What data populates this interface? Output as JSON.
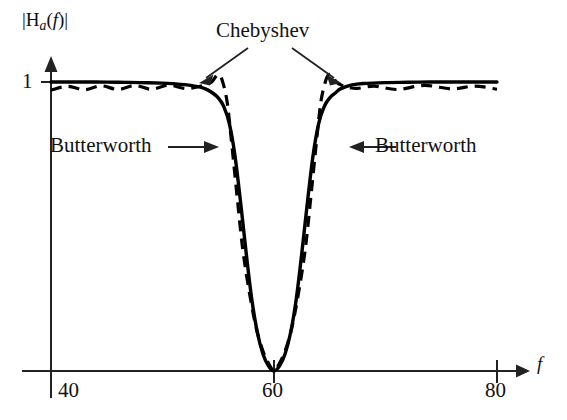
{
  "figure": {
    "axis": {
      "y_label_parts": {
        "bar_open": "|",
        "h": "H",
        "sub_a": "a",
        "paren_open": "(",
        "f": "f",
        "paren_close": ")",
        "bar_close": "|"
      },
      "y_label_text": "|H_a(f)|",
      "x_label": "f",
      "y_tick_label": "1",
      "x_tick_labels": [
        "40",
        "60",
        "80"
      ]
    },
    "annotations": {
      "chebyshev": "Chebyshev",
      "butterworth_left": "Butterworth",
      "butterworth_right": "Butterworth"
    },
    "colors": {
      "ink": "#111111",
      "axis": "#222222",
      "curve": "#000000"
    }
  },
  "chart_data": {
    "type": "line",
    "title": "",
    "subtitle": "",
    "xlabel": "f",
    "ylabel": "|H_a(f)|",
    "xlim": [
      38,
      82
    ],
    "ylim": [
      0,
      1.12
    ],
    "grid": false,
    "legend_position": "inline-annotations",
    "xticks": [
      40,
      60,
      80
    ],
    "yticks": [
      1
    ],
    "xtick_labels": [
      "40",
      "60",
      "80"
    ],
    "ytick_labels": [
      "1"
    ],
    "annotations": [
      {
        "text": "Chebyshev",
        "points_to": [
          [
            55.1,
            1.02
          ],
          [
            65.0,
            1.02
          ]
        ]
      },
      {
        "text": "Butterworth",
        "points_to": [
          [
            56.6,
            0.75
          ]
        ]
      },
      {
        "text": "Butterworth",
        "points_to": [
          [
            64.2,
            0.75
          ]
        ]
      }
    ],
    "series": [
      {
        "name": "Butterworth",
        "style": "solid",
        "x": [
          40.0,
          42.0,
          44.0,
          46.0,
          48.0,
          50.0,
          51.0,
          52.0,
          53.0,
          53.8,
          54.5,
          55.0,
          55.5,
          56.0,
          56.5,
          57.0,
          57.5,
          58.0,
          58.5,
          59.0,
          59.5,
          60.0,
          60.5,
          61.0,
          61.5,
          62.0,
          62.5,
          63.0,
          63.5,
          64.0,
          64.5,
          65.0,
          65.5,
          66.0,
          67.0,
          68.0,
          70.0,
          72.0,
          74.0,
          76.0,
          78.0,
          80.0
        ],
        "y": [
          1.0,
          1.0,
          1.0,
          0.999,
          0.998,
          0.996,
          0.994,
          0.991,
          0.985,
          0.977,
          0.962,
          0.945,
          0.915,
          0.855,
          0.745,
          0.585,
          0.41,
          0.25,
          0.135,
          0.06,
          0.018,
          0.0,
          0.018,
          0.06,
          0.135,
          0.25,
          0.41,
          0.585,
          0.745,
          0.855,
          0.915,
          0.945,
          0.962,
          0.977,
          0.99,
          0.995,
          0.998,
          0.999,
          1.0,
          1.0,
          1.0,
          1.0
        ]
      },
      {
        "name": "Chebyshev",
        "style": "dashed",
        "x": [
          40.0,
          41.5,
          43.0,
          44.5,
          46.0,
          47.5,
          49.0,
          50.5,
          52.0,
          53.0,
          53.8,
          54.4,
          54.8,
          55.1,
          55.4,
          55.8,
          56.2,
          56.7,
          57.2,
          57.8,
          58.4,
          59.0,
          59.6,
          60.0,
          60.4,
          61.0,
          61.6,
          62.2,
          62.8,
          63.3,
          63.8,
          64.2,
          64.6,
          64.9,
          65.2,
          65.6,
          66.0,
          66.6,
          67.5,
          69.0,
          71.0,
          73.5,
          76.0,
          78.0,
          80.0
        ],
        "y": [
          0.972,
          0.985,
          0.973,
          0.987,
          0.974,
          0.988,
          0.975,
          0.989,
          0.978,
          0.982,
          0.99,
          1.0,
          1.02,
          1.025,
          1.0,
          0.93,
          0.79,
          0.6,
          0.42,
          0.27,
          0.15,
          0.07,
          0.02,
          0.0,
          0.02,
          0.07,
          0.15,
          0.27,
          0.42,
          0.6,
          0.79,
          0.93,
          1.0,
          1.025,
          1.02,
          1.0,
          0.99,
          0.982,
          0.978,
          0.986,
          0.974,
          0.988,
          0.976,
          0.986,
          0.975
        ]
      }
    ]
  }
}
